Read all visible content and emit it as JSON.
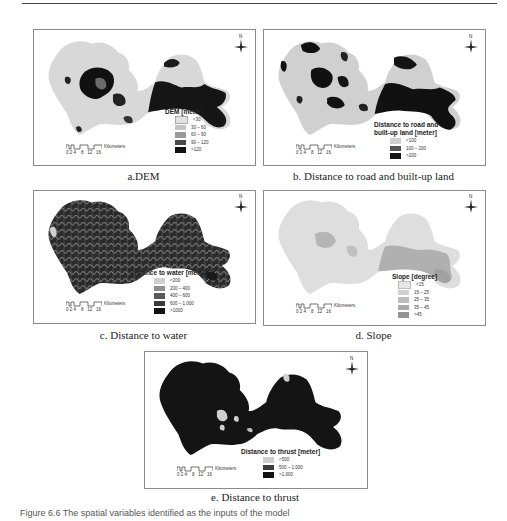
{
  "panels": [
    {
      "id": "a",
      "caption": "a.DEM",
      "legend": {
        "title": "DEM [meter]",
        "items": [
          {
            "label": "<30",
            "color": "#e2e2e2"
          },
          {
            "label": "30 – 60",
            "color": "#c4c4c4"
          },
          {
            "label": "60 – 90",
            "color": "#9a9a9a"
          },
          {
            "label": "90 – 120",
            "color": "#4a4a4a"
          },
          {
            "label": ">120",
            "color": "#111111"
          }
        ]
      }
    },
    {
      "id": "b",
      "caption": "b. Distance to road and built-up land",
      "legend": {
        "title_line1": "Distance to road and",
        "title_line2": "built-up land [meter]",
        "items": [
          {
            "label": "<100",
            "color": "#cfcfcf"
          },
          {
            "label": "100 – 200",
            "color": "#555555"
          },
          {
            "label": ">200",
            "color": "#151515"
          }
        ]
      }
    },
    {
      "id": "c",
      "caption": "c. Distance to water",
      "legend": {
        "title": "Distance to water [meter]",
        "items": [
          {
            "label": "<200",
            "color": "#cfcfcf"
          },
          {
            "label": "200 – 400",
            "color": "#8e8e8e"
          },
          {
            "label": "400 – 600",
            "color": "#5a5a5a"
          },
          {
            "label": "600 – 1,000",
            "color": "#3a3a3a"
          },
          {
            "label": ">1000",
            "color": "#121212"
          }
        ]
      }
    },
    {
      "id": "d",
      "caption": "d. Slope",
      "legend": {
        "title": "Slope [degree]",
        "items": [
          {
            "label": "<15",
            "color": "#e6e6e6"
          },
          {
            "label": "15 – 25",
            "color": "#d0d0d0"
          },
          {
            "label": "25 – 35",
            "color": "#bdbdbd"
          },
          {
            "label": "35 – 45",
            "color": "#a9a9a9"
          },
          {
            "label": ">45",
            "color": "#959595"
          }
        ]
      }
    },
    {
      "id": "e",
      "caption": "e. Distance to thrust",
      "legend": {
        "title": "Distance to thrust [meter]",
        "items": [
          {
            "label": "<500",
            "color": "#cfcfcf"
          },
          {
            "label": "500 – 1,000",
            "color": "#3e3e3e"
          },
          {
            "label": ">1,000",
            "color": "#111111"
          }
        ]
      }
    }
  ],
  "scalebar": {
    "unit": "Kilometers",
    "ticks": "0 2 4    8   12   16"
  },
  "north_label": "N",
  "figure_caption": "Figure 6.6  The spatial variables identified as the inputs of the model"
}
